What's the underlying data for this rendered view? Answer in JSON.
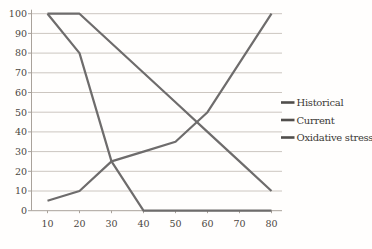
{
  "chart_data": {
    "type": "line",
    "x": [
      10,
      20,
      30,
      40,
      50,
      60,
      70,
      80
    ],
    "x_tick_labels": [
      "10",
      "20",
      "30",
      "40",
      "50",
      "60",
      "70",
      "80"
    ],
    "y_ticks": [
      0,
      10,
      20,
      30,
      40,
      50,
      60,
      70,
      80,
      90,
      100
    ],
    "y_tick_labels": [
      "0",
      "10",
      "20",
      "30",
      "40",
      "50",
      "60",
      "70",
      "80",
      "90",
      "100"
    ],
    "ylim": [
      0,
      100
    ],
    "grid": true,
    "legend_position": "right",
    "series": [
      {
        "name": "Historical",
        "values": [
          100,
          100,
          85,
          70,
          55,
          40,
          25,
          10
        ]
      },
      {
        "name": "Current",
        "values": [
          100,
          80,
          25,
          0,
          0,
          0,
          0,
          0
        ]
      },
      {
        "name": "Oxidative stress",
        "values": [
          5,
          10,
          25,
          30,
          35,
          50,
          75,
          100
        ]
      }
    ],
    "colors": {
      "series_line": "#6e6c6c",
      "gridline": "#ccc6c0",
      "axis": "#a9a29b",
      "tick_text": "#4a4641",
      "legend_text": "#3c3936",
      "legend_marker": "#514e4c",
      "background": "#fffefd"
    }
  }
}
